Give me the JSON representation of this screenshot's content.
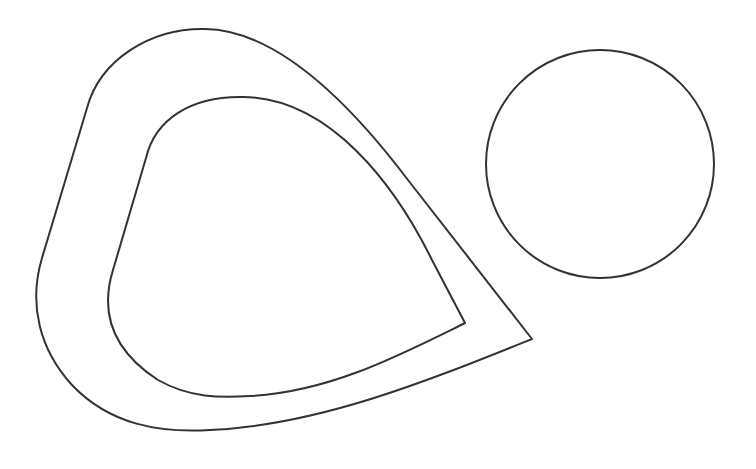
{
  "canvas": {
    "width": 756,
    "height": 469,
    "background": "#ffffff"
  },
  "style": {
    "stroke": "#333333",
    "stroke_width": 2
  },
  "shapes": [
    {
      "id": "outer-teardrop",
      "type": "path",
      "d": "M 532 339 L 408 180 C 355 110 280 30 205 29 C 150 28 100 60 87 108 L 42 258 C 28 305 40 350 72 385 C 110 425 160 433 210 430 C 320 425 430 380 532 339 Z"
    },
    {
      "id": "inner-teardrop",
      "type": "path",
      "d": "M 465 323 L 432 260 C 395 185 330 98 243 97 C 190 96 155 120 146 158 L 113 270 C 100 312 112 350 158 380 C 190 398 220 398 250 396 C 330 392 400 355 465 323 Z"
    },
    {
      "id": "circle",
      "type": "circle",
      "cx": 600,
      "cy": 164,
      "r": 114
    }
  ]
}
